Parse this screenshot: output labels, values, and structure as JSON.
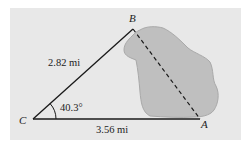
{
  "figure": {
    "type": "triangle-survey-diagram",
    "colors": {
      "panel": "#e8e8e8",
      "lake_fill": "#bfbfbf",
      "lake_stroke": "#a8a8a8",
      "lines": "#1a1a1a"
    },
    "vertices": {
      "A": {
        "label": "A"
      },
      "B": {
        "label": "B"
      },
      "C": {
        "label": "C"
      }
    },
    "sides": {
      "CB": {
        "label": "2.82 mi",
        "style": "solid"
      },
      "CA": {
        "label": "3.56 mi",
        "style": "solid"
      },
      "BA": {
        "label": "",
        "style": "dashed"
      }
    },
    "angle_C": {
      "label": "40.3°"
    },
    "obstacle": "lake"
  }
}
